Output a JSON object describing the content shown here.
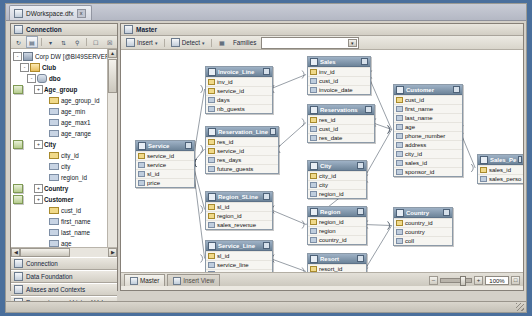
{
  "document_tab": {
    "title": "DWorkspace.dfx",
    "close_label": "x"
  },
  "left_panel": {
    "header": "Connection",
    "toolbar": [
      "refresh-icon",
      "insert-icon",
      "filter-icon",
      "sort-icon",
      "search-icon",
      "expand-icon",
      "collapse-icon"
    ],
    "tree": [
      {
        "depth": 0,
        "label": "Corp DW [@BI49SERVER]",
        "icon": "db",
        "expander": "-",
        "bold": false
      },
      {
        "depth": 1,
        "label": "Club",
        "icon": "fold",
        "expander": "-",
        "bold": true
      },
      {
        "depth": 2,
        "label": "dbo",
        "icon": "user",
        "expander": "-",
        "bold": true
      },
      {
        "depth": 3,
        "label": "Age_group",
        "icon": "tbl",
        "expander": "+",
        "bold": true
      },
      {
        "depth": 4,
        "label": "age_group_id",
        "icon": "colk",
        "expander": "",
        "bold": false
      },
      {
        "depth": 4,
        "label": "age_min",
        "icon": "col",
        "expander": "",
        "bold": false
      },
      {
        "depth": 4,
        "label": "age_max1",
        "icon": "col",
        "expander": "",
        "bold": false
      },
      {
        "depth": 4,
        "label": "age_range",
        "icon": "col",
        "expander": "",
        "bold": false
      },
      {
        "depth": 3,
        "label": "City",
        "icon": "tbl",
        "expander": "+",
        "bold": true
      },
      {
        "depth": 4,
        "label": "city_id",
        "icon": "colk",
        "expander": "",
        "bold": false
      },
      {
        "depth": 4,
        "label": "city",
        "icon": "col",
        "expander": "",
        "bold": false
      },
      {
        "depth": 4,
        "label": "region_id",
        "icon": "col",
        "expander": "",
        "bold": false
      },
      {
        "depth": 3,
        "label": "Country",
        "icon": "tbl",
        "expander": "+",
        "bold": true
      },
      {
        "depth": 3,
        "label": "Customer",
        "icon": "tbl",
        "expander": "+",
        "bold": true
      },
      {
        "depth": 4,
        "label": "cust_id",
        "icon": "colk",
        "expander": "",
        "bold": false
      },
      {
        "depth": 4,
        "label": "first_name",
        "icon": "col",
        "expander": "",
        "bold": false
      },
      {
        "depth": 4,
        "label": "last_name",
        "icon": "col",
        "expander": "",
        "bold": false
      },
      {
        "depth": 4,
        "label": "age",
        "icon": "col",
        "expander": "",
        "bold": false
      },
      {
        "depth": 4,
        "label": "phone_number",
        "icon": "col",
        "expander": "",
        "bold": false
      },
      {
        "depth": 4,
        "label": "address",
        "icon": "col",
        "expander": "",
        "bold": false
      },
      {
        "depth": 4,
        "label": "city_id",
        "icon": "col",
        "expander": "",
        "bold": false
      },
      {
        "depth": 4,
        "label": "sales_id",
        "icon": "col",
        "expander": "",
        "bold": false
      },
      {
        "depth": 4,
        "label": "sponsor_id",
        "icon": "col",
        "expander": "",
        "bold": false
      }
    ],
    "accordion": [
      {
        "label": "Connection",
        "icon": "plug-icon"
      },
      {
        "label": "Data Foundation",
        "icon": "foundation-icon"
      },
      {
        "label": "Aliases and Contexts",
        "icon": "alias-icon"
      },
      {
        "label": "Parameters and Lists of Values",
        "icon": "parameters-icon"
      }
    ]
  },
  "right_panel": {
    "header": "Master",
    "toolbar": {
      "insert_label": "Insert",
      "detect_label": "Detect",
      "families_label": "Families",
      "families_value": ""
    },
    "view_tabs": [
      {
        "label": "Master",
        "active": true
      },
      {
        "label": "Insert View",
        "active": false
      }
    ],
    "zoom": {
      "value": "100%",
      "minus": "–",
      "plus": "+",
      "fit": "□"
    }
  },
  "diagram": {
    "tables": [
      {
        "name": "Service",
        "x": 14,
        "y": 90,
        "w": 58,
        "fields": [
          {
            "n": "service_id",
            "k": true
          },
          {
            "n": "service",
            "k": false
          },
          {
            "n": "sl_id",
            "k": false
          },
          {
            "n": "price",
            "k": false
          }
        ]
      },
      {
        "name": "Invoice_Line",
        "x": 84,
        "y": 16,
        "w": 66,
        "fields": [
          {
            "n": "inv_id",
            "k": true
          },
          {
            "n": "service_id",
            "k": true
          },
          {
            "n": "days",
            "k": false
          },
          {
            "n": "nb_guests",
            "k": false
          }
        ]
      },
      {
        "name": "Reservation_Line",
        "x": 84,
        "y": 76,
        "w": 72,
        "fields": [
          {
            "n": "res_id",
            "k": true
          },
          {
            "n": "service_id",
            "k": true
          },
          {
            "n": "res_days",
            "k": false
          },
          {
            "n": "future_guests",
            "k": false
          }
        ]
      },
      {
        "name": "Region_SLine",
        "x": 84,
        "y": 141,
        "w": 66,
        "fields": [
          {
            "n": "sl_id",
            "k": true
          },
          {
            "n": "region_id",
            "k": true
          },
          {
            "n": "sales_revenue",
            "k": false
          }
        ]
      },
      {
        "name": "Service_Line",
        "x": 84,
        "y": 190,
        "w": 66,
        "fields": [
          {
            "n": "sl_id",
            "k": true
          },
          {
            "n": "service_line",
            "k": false
          },
          {
            "n": "resort_id",
            "k": false
          }
        ]
      },
      {
        "name": "Sales",
        "x": 186,
        "y": 6,
        "w": 62,
        "fields": [
          {
            "n": "inv_id",
            "k": true
          },
          {
            "n": "cust_id",
            "k": false
          },
          {
            "n": "invoice_date",
            "k": false
          }
        ]
      },
      {
        "name": "Reservations",
        "x": 186,
        "y": 54,
        "w": 66,
        "fields": [
          {
            "n": "res_id",
            "k": true
          },
          {
            "n": "cust_id",
            "k": false
          },
          {
            "n": "res_date",
            "k": false
          }
        ]
      },
      {
        "name": "City",
        "x": 186,
        "y": 110,
        "w": 58,
        "fields": [
          {
            "n": "city_id",
            "k": true
          },
          {
            "n": "city",
            "k": false
          },
          {
            "n": "region_id",
            "k": false
          }
        ]
      },
      {
        "name": "Region",
        "x": 186,
        "y": 156,
        "w": 58,
        "fields": [
          {
            "n": "region_id",
            "k": true
          },
          {
            "n": "region",
            "k": false
          },
          {
            "n": "country_id",
            "k": false
          }
        ]
      },
      {
        "name": "Resort",
        "x": 186,
        "y": 203,
        "w": 58,
        "fields": [
          {
            "n": "resort_id",
            "k": true
          },
          {
            "n": "resort",
            "k": false
          },
          {
            "n": "country_id",
            "k": false
          }
        ]
      },
      {
        "name": "Customer",
        "x": 272,
        "y": 34,
        "w": 68,
        "fields": [
          {
            "n": "cust_id",
            "k": true
          },
          {
            "n": "first_name",
            "k": false
          },
          {
            "n": "last_name",
            "k": false
          },
          {
            "n": "age",
            "k": false
          },
          {
            "n": "phone_number",
            "k": false
          },
          {
            "n": "address",
            "k": false
          },
          {
            "n": "city_id",
            "k": false
          },
          {
            "n": "sales_id",
            "k": false
          },
          {
            "n": "sponsor_id",
            "k": false
          }
        ]
      },
      {
        "name": "Country",
        "x": 272,
        "y": 157,
        "w": 58,
        "fields": [
          {
            "n": "country_id",
            "k": true
          },
          {
            "n": "country",
            "k": false
          },
          {
            "n": "coll",
            "k": false
          }
        ]
      },
      {
        "name": "Sales_Pe",
        "x": 356,
        "y": 104,
        "w": 46,
        "fields": [
          {
            "n": "sales_id",
            "k": true
          },
          {
            "n": "sales_perso",
            "k": false
          }
        ]
      }
    ],
    "joins": [
      [
        "Service",
        "Invoice_Line"
      ],
      [
        "Service",
        "Reservation_Line"
      ],
      [
        "Service",
        "Region_SLine"
      ],
      [
        "Service",
        "Service_Line"
      ],
      [
        "Invoice_Line",
        "Sales"
      ],
      [
        "Reservation_Line",
        "Reservations"
      ],
      [
        "Sales",
        "Customer"
      ],
      [
        "Reservations",
        "Customer"
      ],
      [
        "City",
        "Customer"
      ],
      [
        "City",
        "Region"
      ],
      [
        "Region",
        "Country"
      ],
      [
        "Region",
        "Region_SLine"
      ],
      [
        "Resort",
        "Country"
      ],
      [
        "Service_Line",
        "Resort"
      ],
      [
        "Customer",
        "Sales_Pe"
      ]
    ]
  },
  "colors": {
    "title_bar": "#6d8499",
    "panel": "#ece9e2",
    "canvas": "#ffffff",
    "desktop": "#4a6f9c"
  }
}
